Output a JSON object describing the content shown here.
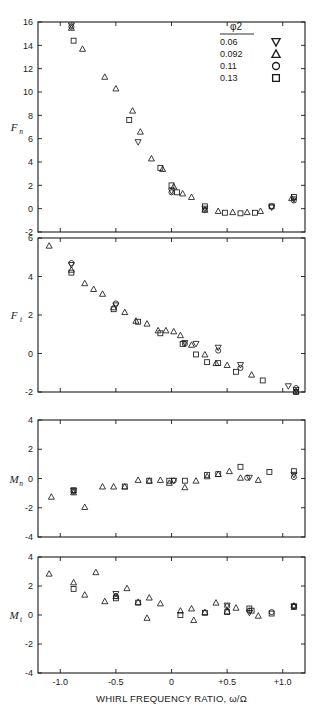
{
  "figure": {
    "xaxis_title": "WHIRL FREQUENCY RATIO, ω/Ω",
    "legend": {
      "title": "φ2",
      "entries": [
        {
          "label": "0.06",
          "marker": "down-triangle"
        },
        {
          "label": "0.092",
          "marker": "up-triangle"
        },
        {
          "label": "0.11",
          "marker": "circle"
        },
        {
          "label": "0.13",
          "marker": "square"
        }
      ]
    }
  },
  "chart_data": [
    {
      "type": "scatter",
      "title": "",
      "panel": "Fn",
      "ylabel": "F_n",
      "ylabel_base": "F",
      "ylabel_sub": "n",
      "xlabel": "WHIRL FREQUENCY RATIO, ω/Ω",
      "xlim": [
        -1.2,
        1.2
      ],
      "ylim": [
        -2,
        16
      ],
      "xticks": [
        -1.0,
        -0.5,
        0,
        0.5,
        1.0
      ],
      "xticklabels": [
        "-1.0",
        "-0.5",
        "0",
        "+0.5",
        "+1.0"
      ],
      "yticks": [
        -2,
        0,
        2,
        4,
        6,
        8,
        10,
        12,
        14,
        16
      ],
      "yticklabels": [
        "-2",
        "0",
        "2",
        "4",
        "6",
        "8",
        "10",
        "12",
        "14",
        "16"
      ],
      "grid": false,
      "series": [
        {
          "name": "0.06",
          "marker": "down-triangle",
          "points": [
            [
              -0.9,
              15.7
            ],
            [
              -0.3,
              5.7
            ],
            [
              0.0,
              1.5
            ],
            [
              0.3,
              0.0
            ],
            [
              0.9,
              0.1
            ],
            [
              1.1,
              0.8
            ]
          ]
        },
        {
          "name": "0.092",
          "marker": "up-triangle",
          "points": [
            [
              -0.9,
              15.5
            ],
            [
              -0.8,
              13.7
            ],
            [
              -0.6,
              11.3
            ],
            [
              -0.5,
              10.3
            ],
            [
              -0.35,
              8.4
            ],
            [
              -0.28,
              6.6
            ],
            [
              -0.18,
              4.3
            ],
            [
              -0.08,
              3.4
            ],
            [
              0.02,
              1.9
            ],
            [
              0.1,
              1.3
            ],
            [
              0.18,
              1.0
            ],
            [
              0.3,
              -0.1
            ],
            [
              0.42,
              -0.2
            ],
            [
              0.55,
              -0.3
            ],
            [
              0.68,
              -0.3
            ],
            [
              0.8,
              -0.2
            ],
            [
              1.08,
              0.9
            ]
          ]
        },
        {
          "name": "0.11",
          "marker": "circle",
          "points": [
            [
              -0.9,
              15.6
            ],
            [
              0.0,
              1.4
            ],
            [
              0.3,
              -0.1
            ],
            [
              0.9,
              0.2
            ],
            [
              1.1,
              0.7
            ]
          ]
        },
        {
          "name": "0.13",
          "marker": "square",
          "points": [
            [
              -0.88,
              14.4
            ],
            [
              -0.38,
              7.6
            ],
            [
              -0.1,
              3.5
            ],
            [
              0.0,
              2.0
            ],
            [
              0.05,
              1.4
            ],
            [
              0.3,
              0.2
            ],
            [
              0.48,
              -0.35
            ],
            [
              0.62,
              -0.4
            ],
            [
              0.75,
              -0.35
            ],
            [
              0.9,
              0.2
            ],
            [
              1.1,
              1.0
            ]
          ]
        }
      ]
    },
    {
      "type": "scatter",
      "title": "",
      "panel": "Ft",
      "ylabel": "F_t",
      "ylabel_base": "F",
      "ylabel_sub": "t",
      "xlabel": "WHIRL FREQUENCY RATIO, ω/Ω",
      "xlim": [
        -1.2,
        1.2
      ],
      "ylim": [
        -2,
        6
      ],
      "xticks": [
        -1.0,
        -0.5,
        0,
        0.5,
        1.0
      ],
      "xticklabels": [
        "-1.0",
        "-0.5",
        "0",
        "+0.5",
        "+1.0"
      ],
      "yticks": [
        -2,
        0,
        2,
        4,
        6
      ],
      "yticklabels": [
        "-2",
        "0",
        "2",
        "4",
        "6"
      ],
      "grid": false,
      "series": [
        {
          "name": "0.06",
          "marker": "down-triangle",
          "points": [
            [
              -0.9,
              4.6
            ],
            [
              -0.5,
              2.5
            ],
            [
              0.12,
              0.55
            ],
            [
              0.22,
              0.5
            ],
            [
              0.42,
              0.3
            ],
            [
              0.62,
              -0.6
            ],
            [
              1.05,
              -1.7
            ],
            [
              1.12,
              -1.9
            ]
          ]
        },
        {
          "name": "0.092",
          "marker": "up-triangle",
          "points": [
            [
              -1.1,
              5.6
            ],
            [
              -0.9,
              4.35
            ],
            [
              -0.78,
              3.65
            ],
            [
              -0.7,
              3.35
            ],
            [
              -0.62,
              3.1
            ],
            [
              -0.52,
              2.4
            ],
            [
              -0.42,
              2.15
            ],
            [
              -0.32,
              1.7
            ],
            [
              -0.22,
              1.55
            ],
            [
              -0.12,
              1.2
            ],
            [
              -0.05,
              1.2
            ],
            [
              0.02,
              1.15
            ],
            [
              0.08,
              0.95
            ],
            [
              0.18,
              0.45
            ],
            [
              0.3,
              -0.05
            ],
            [
              0.4,
              -0.5
            ],
            [
              0.5,
              -0.6
            ],
            [
              0.72,
              -1.1
            ],
            [
              1.12,
              -1.95
            ]
          ]
        },
        {
          "name": "0.11",
          "marker": "circle",
          "points": [
            [
              -0.9,
              4.7
            ],
            [
              -0.5,
              2.6
            ],
            [
              0.12,
              0.5
            ],
            [
              0.42,
              0.15
            ],
            [
              0.62,
              -0.75
            ],
            [
              1.12,
              -1.8
            ]
          ]
        },
        {
          "name": "0.13",
          "marker": "square",
          "points": [
            [
              -0.9,
              4.2
            ],
            [
              -0.52,
              2.3
            ],
            [
              -0.3,
              1.65
            ],
            [
              -0.1,
              1.05
            ],
            [
              0.1,
              0.5
            ],
            [
              0.22,
              -0.05
            ],
            [
              0.32,
              -0.45
            ],
            [
              0.42,
              -0.5
            ],
            [
              0.58,
              -0.95
            ],
            [
              0.82,
              -1.4
            ],
            [
              1.12,
              -2.0
            ]
          ]
        }
      ]
    },
    {
      "type": "scatter",
      "title": "",
      "panel": "Mn",
      "ylabel": "M_n",
      "ylabel_base": "M",
      "ylabel_sub": "n",
      "xlabel": "WHIRL FREQUENCY RATIO, ω/Ω",
      "xlim": [
        -1.2,
        1.2
      ],
      "ylim": [
        -4,
        4
      ],
      "xticks": [
        -1.0,
        -0.5,
        0,
        0.5,
        1.0
      ],
      "xticklabels": [
        "-1.0",
        "-0.5",
        "0",
        "+0.5",
        "+1.0"
      ],
      "yticks": [
        -4,
        -2,
        0,
        2,
        4
      ],
      "yticklabels": [
        "-4",
        "-2",
        "0",
        "2",
        "4"
      ],
      "grid": false,
      "series": [
        {
          "name": "0.06",
          "marker": "down-triangle",
          "points": [
            [
              -0.88,
              -0.85
            ],
            [
              0.02,
              -0.15
            ],
            [
              0.7,
              0.05
            ],
            [
              1.1,
              0.25
            ]
          ]
        },
        {
          "name": "0.092",
          "marker": "up-triangle",
          "points": [
            [
              -1.08,
              -1.25
            ],
            [
              -0.88,
              -0.95
            ],
            [
              -0.78,
              -1.95
            ],
            [
              -0.62,
              -0.55
            ],
            [
              -0.52,
              -0.55
            ],
            [
              -0.42,
              -0.55
            ],
            [
              -0.3,
              -0.1
            ],
            [
              -0.2,
              -0.15
            ],
            [
              -0.1,
              -0.1
            ],
            [
              -0.02,
              -0.3
            ],
            [
              0.12,
              -0.6
            ],
            [
              0.22,
              -0.15
            ],
            [
              0.32,
              0.15
            ],
            [
              0.42,
              0.3
            ],
            [
              0.52,
              0.5
            ],
            [
              0.62,
              0.05
            ],
            [
              0.78,
              -0.1
            ]
          ]
        },
        {
          "name": "0.11",
          "marker": "circle",
          "points": [
            [
              -0.88,
              -0.9
            ],
            [
              0.02,
              -0.15
            ],
            [
              0.68,
              0.05
            ],
            [
              1.1,
              0.1
            ]
          ]
        },
        {
          "name": "0.13",
          "marker": "square",
          "points": [
            [
              -0.88,
              -0.8
            ],
            [
              -0.42,
              -0.55
            ],
            [
              -0.2,
              -0.15
            ],
            [
              -0.02,
              -0.15
            ],
            [
              0.12,
              -0.15
            ],
            [
              0.32,
              0.25
            ],
            [
              0.42,
              0.3
            ],
            [
              0.62,
              0.8
            ],
            [
              0.88,
              0.45
            ],
            [
              1.1,
              0.5
            ]
          ]
        }
      ]
    },
    {
      "type": "scatter",
      "title": "",
      "panel": "Mt",
      "ylabel": "M_t",
      "ylabel_base": "M",
      "ylabel_sub": "t",
      "xlabel": "WHIRL FREQUENCY RATIO, ω/Ω",
      "xlim": [
        -1.2,
        1.2
      ],
      "ylim": [
        -4,
        4
      ],
      "xticks": [
        -1.0,
        -0.5,
        0,
        0.5,
        1.0
      ],
      "xticklabels": [
        "-1.0",
        "-0.5",
        "0",
        "+0.5",
        "+1.0"
      ],
      "yticks": [
        -4,
        -2,
        0,
        2,
        4
      ],
      "yticklabels": [
        "-4",
        "-2",
        "0",
        "2",
        "4"
      ],
      "grid": false,
      "series": [
        {
          "name": "0.06",
          "marker": "down-triangle",
          "points": [
            [
              -0.5,
              1.45
            ],
            [
              0.5,
              0.65
            ],
            [
              0.7,
              0.15
            ],
            [
              1.1,
              0.6
            ]
          ]
        },
        {
          "name": "0.092",
          "marker": "up-triangle",
          "points": [
            [
              -1.1,
              2.85
            ],
            [
              -0.88,
              2.25
            ],
            [
              -0.78,
              1.4
            ],
            [
              -0.6,
              0.95
            ],
            [
              -0.68,
              2.95
            ],
            [
              -0.5,
              1.3
            ],
            [
              -0.4,
              1.85
            ],
            [
              -0.3,
              0.9
            ],
            [
              -0.2,
              1.2
            ],
            [
              -0.22,
              -0.2
            ],
            [
              -0.1,
              0.8
            ],
            [
              0.08,
              0.3
            ],
            [
              0.18,
              0.45
            ],
            [
              0.2,
              -0.35
            ],
            [
              0.3,
              0.2
            ],
            [
              0.4,
              0.85
            ],
            [
              0.5,
              0.25
            ],
            [
              0.58,
              0.5
            ],
            [
              0.78,
              -0.05
            ],
            [
              1.1,
              0.65
            ]
          ]
        },
        {
          "name": "0.11",
          "marker": "circle",
          "points": [
            [
              -0.5,
              1.3
            ],
            [
              0.5,
              0.6
            ],
            [
              0.7,
              0.3
            ],
            [
              0.9,
              0.2
            ],
            [
              1.1,
              0.6
            ]
          ]
        },
        {
          "name": "0.13",
          "marker": "square",
          "points": [
            [
              -0.88,
              1.8
            ],
            [
              -0.5,
              1.15
            ],
            [
              -0.3,
              0.85
            ],
            [
              0.08,
              0.0
            ],
            [
              0.3,
              0.15
            ],
            [
              0.5,
              0.2
            ],
            [
              0.7,
              0.45
            ],
            [
              0.72,
              0.3
            ],
            [
              0.9,
              0.1
            ],
            [
              1.1,
              0.55
            ]
          ]
        }
      ]
    }
  ]
}
